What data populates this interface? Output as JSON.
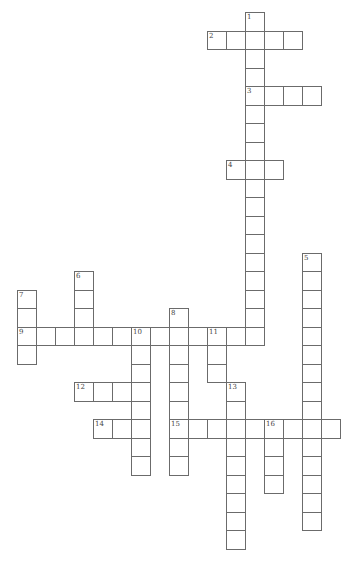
{
  "puzzle": {
    "type": "crossword",
    "entries": [
      {
        "number": "1",
        "direction": "down",
        "row": 0,
        "col": 12,
        "length": 18
      },
      {
        "number": "2",
        "direction": "across",
        "row": 1,
        "col": 10,
        "length": 5
      },
      {
        "number": "3",
        "direction": "across",
        "row": 4,
        "col": 12,
        "length": 4
      },
      {
        "number": "4",
        "direction": "across",
        "row": 8,
        "col": 11,
        "length": 3
      },
      {
        "number": "5",
        "direction": "down",
        "row": 13,
        "col": 15,
        "length": 15
      },
      {
        "number": "6",
        "direction": "down",
        "row": 14,
        "col": 3,
        "length": 4
      },
      {
        "number": "7",
        "direction": "down",
        "row": 15,
        "col": 0,
        "length": 4
      },
      {
        "number": "8",
        "direction": "down",
        "row": 16,
        "col": 8,
        "length": 9
      },
      {
        "number": "9",
        "direction": "across",
        "row": 17,
        "col": 0,
        "length": 13
      },
      {
        "number": "10",
        "direction": "down",
        "row": 17,
        "col": 6,
        "length": 8
      },
      {
        "number": "11",
        "direction": "down",
        "row": 17,
        "col": 10,
        "length": 3
      },
      {
        "number": "12",
        "direction": "across",
        "row": 20,
        "col": 3,
        "length": 4
      },
      {
        "number": "13",
        "direction": "down",
        "row": 20,
        "col": 11,
        "length": 9
      },
      {
        "number": "14",
        "direction": "across",
        "row": 22,
        "col": 4,
        "length": 3
      },
      {
        "number": "15",
        "direction": "across",
        "row": 22,
        "col": 8,
        "length": 9
      },
      {
        "number": "16",
        "direction": "down",
        "row": 22,
        "col": 13,
        "length": 4
      }
    ]
  }
}
